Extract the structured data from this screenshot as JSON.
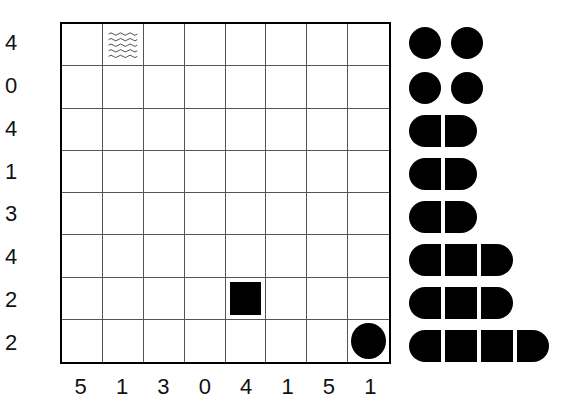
{
  "puzzle": {
    "type": "battleships",
    "rows": 8,
    "cols": 8,
    "row_clues": [
      "4",
      "0",
      "4",
      "1",
      "3",
      "4",
      "2",
      "2"
    ],
    "col_clues": [
      "5",
      "1",
      "3",
      "0",
      "4",
      "1",
      "5",
      "1"
    ],
    "given_cells": [
      {
        "row": 0,
        "col": 1,
        "kind": "water",
        "icon": "water-wave-icon"
      },
      {
        "row": 6,
        "col": 4,
        "kind": "ship-middle",
        "icon": "ship-square-icon"
      },
      {
        "row": 7,
        "col": 7,
        "kind": "ship-submarine",
        "icon": "ship-circle-icon"
      }
    ]
  },
  "fleet": [
    {
      "length": 1,
      "count": 2
    },
    {
      "length": 1,
      "count": 2
    },
    {
      "length": 2,
      "count": 1
    },
    {
      "length": 2,
      "count": 1
    },
    {
      "length": 2,
      "count": 1
    },
    {
      "length": 3,
      "count": 1
    },
    {
      "length": 3,
      "count": 1
    },
    {
      "length": 4,
      "count": 1
    }
  ]
}
